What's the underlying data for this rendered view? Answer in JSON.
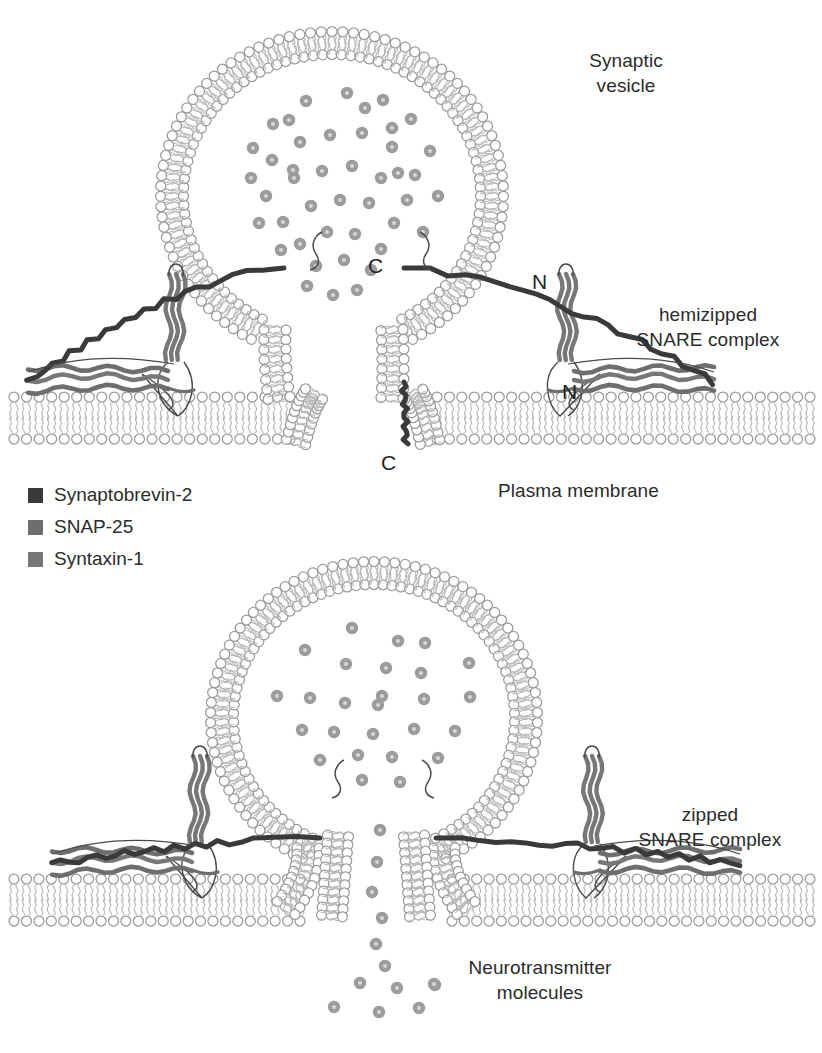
{
  "figure": {
    "background": "#ffffff"
  },
  "colors": {
    "synaptobrevin": "#3a3a3a",
    "snap25": "#6e6e6e",
    "syntaxin": "#777777",
    "lipid_head_stroke": "#9a9a9a",
    "lipid_tail": "#b9b9b9",
    "neurotransmitter_fill": "#9c9c9c",
    "neurotransmitter_core": "#d8d8d8",
    "outline": "#4a4a4a",
    "text": "#2b2b2b"
  },
  "legend": {
    "items": [
      {
        "label": "Synaptobrevin-2",
        "color": "#3a3a3a"
      },
      {
        "label": "SNAP-25",
        "color": "#6e6e6e"
      },
      {
        "label": "Syntaxin-1",
        "color": "#777777"
      }
    ]
  },
  "labels": {
    "synaptic_vesicle": "Synaptic\nvesicle",
    "hemizipped": "hemizipped\nSNARE complex",
    "plasma_membrane": "Plasma membrane",
    "zipped": "zipped\nSNARE complex",
    "neurotransmitter": "Neurotransmitter\nmolecules"
  },
  "terminals": {
    "top_c": "C",
    "top_n_right": "N",
    "lower_n": "N",
    "bottom_c": "C"
  },
  "panels": [
    {
      "id": "hemizipped",
      "state": "hemizipped SNARE complex",
      "vesicle": {
        "cx": 332,
        "cy": 195,
        "rx": 160,
        "ry": 152
      },
      "neurotransmitters_inside": 44,
      "fusion_pore_open": false,
      "released_neurotransmitters": 0
    },
    {
      "id": "zipped",
      "state": "zipped SNARE complex",
      "vesicle": {
        "cx": 374,
        "cy": 718,
        "rx": 152,
        "ry": 145
      },
      "neurotransmitters_inside": 26,
      "fusion_pore_open": true,
      "released_neurotransmitters": 12
    }
  ],
  "neurotransmitter_dots_top": [
    [
      273,
      124
    ],
    [
      306,
      101
    ],
    [
      347,
      93
    ],
    [
      383,
      100
    ],
    [
      411,
      119
    ],
    [
      430,
      151
    ],
    [
      272,
      160
    ],
    [
      300,
      142
    ],
    [
      330,
      135
    ],
    [
      362,
      133
    ],
    [
      392,
      147
    ],
    [
      415,
      175
    ],
    [
      266,
      196
    ],
    [
      294,
      178
    ],
    [
      322,
      171
    ],
    [
      352,
      166
    ],
    [
      381,
      178
    ],
    [
      407,
      200
    ],
    [
      283,
      222
    ],
    [
      311,
      206
    ],
    [
      340,
      200
    ],
    [
      369,
      203
    ],
    [
      394,
      223
    ],
    [
      300,
      244
    ],
    [
      327,
      232
    ],
    [
      355,
      234
    ],
    [
      381,
      249
    ],
    [
      316,
      266
    ],
    [
      344,
      260
    ],
    [
      371,
      270
    ],
    [
      289,
      120
    ],
    [
      251,
      178
    ],
    [
      438,
      196
    ],
    [
      259,
      223
    ],
    [
      423,
      232
    ],
    [
      293,
      170
    ],
    [
      365,
      108
    ],
    [
      398,
      173
    ],
    [
      281,
      250
    ],
    [
      357,
      290
    ],
    [
      333,
      295
    ],
    [
      307,
      286
    ],
    [
      392,
      128
    ],
    [
      253,
      148
    ]
  ],
  "neurotransmitter_dots_bottom": [
    [
      352,
      628
    ],
    [
      398,
      641
    ],
    [
      425,
      643
    ],
    [
      305,
      650
    ],
    [
      346,
      664
    ],
    [
      386,
      668
    ],
    [
      421,
      673
    ],
    [
      469,
      663
    ],
    [
      277,
      696
    ],
    [
      310,
      698
    ],
    [
      345,
      703
    ],
    [
      382,
      696
    ],
    [
      424,
      699
    ],
    [
      470,
      697
    ],
    [
      302,
      730
    ],
    [
      334,
      732
    ],
    [
      373,
      734
    ],
    [
      414,
      729
    ],
    [
      455,
      731
    ],
    [
      358,
      755
    ],
    [
      392,
      757
    ],
    [
      320,
      760
    ],
    [
      438,
      758
    ],
    [
      362,
      780
    ],
    [
      400,
      782
    ],
    [
      378,
      705
    ]
  ],
  "released_dots": [
    [
      380,
      830
    ],
    [
      377,
      862
    ],
    [
      372,
      892
    ],
    [
      382,
      918
    ],
    [
      376,
      944
    ],
    [
      385,
      966
    ],
    [
      360,
      983
    ],
    [
      397,
      988
    ],
    [
      334,
      1007
    ],
    [
      379,
      1012
    ],
    [
      419,
      1008
    ],
    [
      435,
      985
    ]
  ],
  "legend_nt_dot": {
    "x": 434,
    "y": 984
  }
}
